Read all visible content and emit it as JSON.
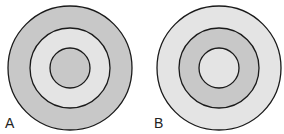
{
  "colors": {
    "dark_fill": "#c8c8c8",
    "light_fill": "#e4e4e4",
    "stroke": "#1a1a1a",
    "background": "#ffffff"
  },
  "figures": [
    {
      "label": "A",
      "center": [
        70,
        68
      ],
      "rings": [
        {
          "r": 62,
          "fill": "#c8c8c8"
        },
        {
          "r": 40,
          "fill": "#e4e4e4"
        },
        {
          "r": 20,
          "fill": "#c8c8c8"
        }
      ]
    },
    {
      "label": "B",
      "center": [
        219,
        68
      ],
      "rings": [
        {
          "r": 62,
          "fill": "#e4e4e4"
        },
        {
          "r": 40,
          "fill": "#c8c8c8"
        },
        {
          "r": 20,
          "fill": "#e4e4e4"
        }
      ]
    }
  ]
}
